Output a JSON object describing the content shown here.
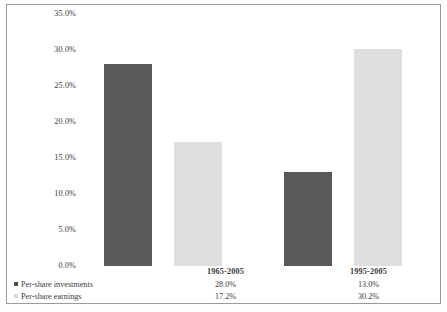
{
  "chart_data": {
    "type": "bar",
    "title": "",
    "subtitle": "",
    "xlabel": "",
    "ylabel": "",
    "categories": [
      "1965-2005",
      "1995-2005"
    ],
    "series": [
      {
        "name": "Per-share investments",
        "values": [
          28.0,
          17.2
        ],
        "color": "#595959"
      },
      {
        "name": "Per-share earnings",
        "values": [
          13.0,
          30.2
        ],
        "color": "#dedede"
      }
    ],
    "value_labels": [
      [
        "28.0%",
        "17.2%"
      ],
      [
        "13.0%",
        "30.2%"
      ]
    ],
    "ylim": [
      0,
      35
    ],
    "ytick_values": [
      35.0,
      30.0,
      25.0,
      20.0,
      15.0,
      10.0,
      5.0,
      0.0
    ],
    "ytick_labels": [
      "35.0%",
      "30.0%",
      "25.0%",
      "20.0%",
      "15.0%",
      "10.0%",
      "5.0%",
      "0.0%"
    ],
    "grid": false,
    "legend_position": "bottom-left",
    "bars": [
      {
        "group": "1965-2005",
        "series": "Per-share investments",
        "value": 28.0,
        "label": "28.0%",
        "shade": "dark"
      },
      {
        "group": "1965-2005",
        "series": "Per-share earnings",
        "value": 17.2,
        "label": "17.2%",
        "shade": "light"
      },
      {
        "group": "1995-2005",
        "series": "Per-share investments",
        "value": 13.0,
        "label": "13.0%",
        "shade": "dark"
      },
      {
        "group": "1995-2005",
        "series": "Per-share earnings",
        "value": 30.2,
        "label": "30.2%",
        "shade": "light"
      }
    ]
  },
  "axis": {
    "ytick_0": "35.0%",
    "ytick_1": "30.0%",
    "ytick_2": "25.0%",
    "ytick_3": "20.0%",
    "ytick_4": "15.0%",
    "ytick_5": "10.0%",
    "ytick_6": "5.0%",
    "ytick_7": "0.0%"
  },
  "table": {
    "group_1_label": "1965-2005",
    "group_2_label": "1995-2005",
    "row_1_legend": "Per-share investments",
    "row_2_legend": "Per-share earnings",
    "row_1_group_1_value": "28.0%",
    "row_1_group_2_value": "13.0%",
    "row_2_group_1_value": "17.2%",
    "row_2_group_2_value": "30.2%"
  },
  "colors": {
    "investments": "#595959",
    "earnings": "#dedede",
    "frame": "#9a9a9a",
    "text": "#3b3b3b"
  }
}
